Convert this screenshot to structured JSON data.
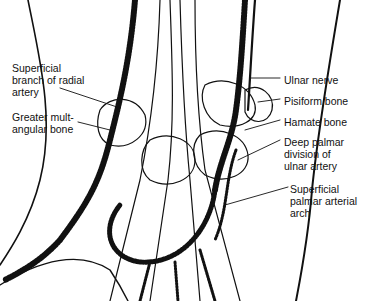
{
  "figure": {
    "labels": [
      {
        "id": "superficial-branch-radial-artery",
        "text": "Superficial\nbranch of radial\nartery",
        "x": 12,
        "y": 62,
        "side": "left"
      },
      {
        "id": "greater-multangular-bone",
        "text": "Greater mult-\nangular bone",
        "x": 12,
        "y": 111,
        "side": "left"
      },
      {
        "id": "ulnar-nerve",
        "text": "Ulnar nerve",
        "x": 284,
        "y": 74,
        "side": "right"
      },
      {
        "id": "pisiform-bone",
        "text": "Pisiform bone",
        "x": 284,
        "y": 95,
        "side": "right"
      },
      {
        "id": "hamate-bone",
        "text": "Hamate bone",
        "x": 284,
        "y": 116,
        "side": "right"
      },
      {
        "id": "deep-palmar-division-ulnar-artery",
        "text": "Deep palmar\ndivision of\nulnar artery",
        "x": 284,
        "y": 136,
        "side": "right"
      },
      {
        "id": "superficial-palmar-arterial-arch",
        "text": "Superficial\npalmar arterial\narch",
        "x": 290,
        "y": 183,
        "side": "right"
      }
    ]
  }
}
